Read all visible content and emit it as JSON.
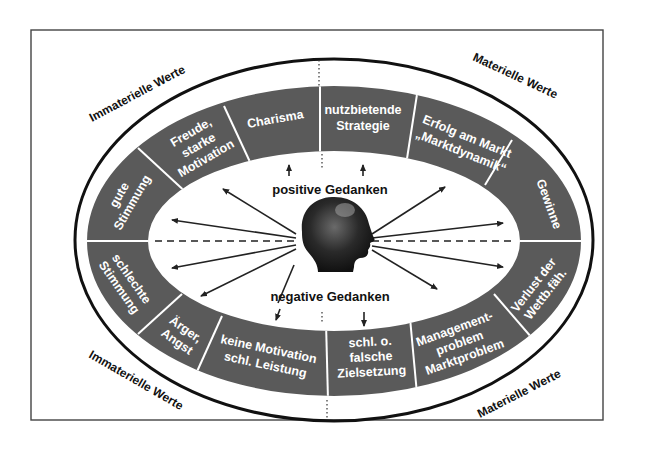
{
  "diagram": {
    "colors": {
      "band": "#5a5a5a",
      "band_text": "#ffffff",
      "outline": "#111111",
      "frame": "#444444",
      "background": "#ffffff",
      "arrow": "#222222"
    },
    "corner_labels": {
      "top_left": "Immaterielle Werte",
      "top_right": "Materielle Werte",
      "bottom_left": "Immaterielle Werte",
      "bottom_right": "Materielle Werte"
    },
    "center": {
      "positive_label": "positive Gedanken",
      "negative_label": "negative Gedanken",
      "image": "head-silhouette"
    },
    "segments_top": [
      {
        "id": "gute-stimmung",
        "lines": [
          "gute",
          "Stimmung"
        ]
      },
      {
        "id": "freude",
        "lines": [
          "Freude,",
          "starke",
          "Motivation"
        ]
      },
      {
        "id": "charisma",
        "lines": [
          "Charisma"
        ]
      },
      {
        "id": "nutzbietende-strategie",
        "lines": [
          "nutzbietende",
          "Strategie"
        ]
      },
      {
        "id": "erfolg-am-markt",
        "lines": [
          "Erfolg am Markt",
          "„Marktdynamik“"
        ]
      },
      {
        "id": "gewinne",
        "lines": [
          "Gewinne"
        ]
      }
    ],
    "segments_bottom": [
      {
        "id": "schlechte-stimmung",
        "lines": [
          "schlechte",
          "Stimmung"
        ]
      },
      {
        "id": "aerger-angst",
        "lines": [
          "Ärger,",
          "Angst"
        ]
      },
      {
        "id": "keine-motivation",
        "lines": [
          "keine Motivation",
          "schl. Leistung"
        ]
      },
      {
        "id": "falsche-zielsetzung",
        "lines": [
          "schl. o.",
          "falsche",
          "Zielsetzung"
        ]
      },
      {
        "id": "managementproblem",
        "lines": [
          "Management-",
          "problem",
          "Marktproblem"
        ]
      },
      {
        "id": "verlust-wettbewerb",
        "lines": [
          "Verlust der",
          "Wettb.fäh."
        ]
      }
    ]
  }
}
